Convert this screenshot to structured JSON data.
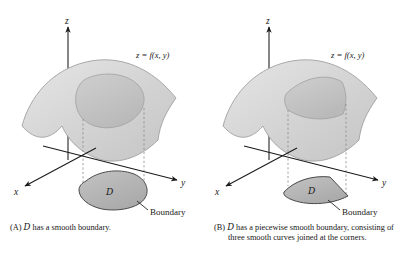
{
  "figure": {
    "type": "two-panel-3d-math-diagram",
    "background_color": "#ffffff",
    "ink_color": "#1a1a1a",
    "surface_fill": "#d9d9d9",
    "surface_patch_fill": "#c2c2c2",
    "domain_fill": "#b5b5b5",
    "domain_stroke": "#4a4a4a",
    "dashed_color": "#8c8c8c"
  },
  "panels": [
    {
      "id": "panel-a",
      "axes": {
        "z_label": "z",
        "x_label": "x",
        "y_label": "y"
      },
      "surface_label": "z = f(x, y)",
      "domain_label": "D",
      "boundary_label": "Boundary",
      "domain_shape": "smooth-blob",
      "caption": {
        "marker": "(A)",
        "symbol": "D",
        "text": "has a smooth boundary."
      }
    },
    {
      "id": "panel-b",
      "axes": {
        "z_label": "z",
        "x_label": "x",
        "y_label": "y"
      },
      "surface_label": "z = f(x, y)",
      "domain_label": "D",
      "boundary_label": "Boundary",
      "domain_shape": "three-sided-wedge",
      "caption": {
        "marker": "(B)",
        "symbol": "D",
        "text": "has a piecewise smooth boundary, consisting of three smooth curves joined at the corners."
      }
    }
  ]
}
